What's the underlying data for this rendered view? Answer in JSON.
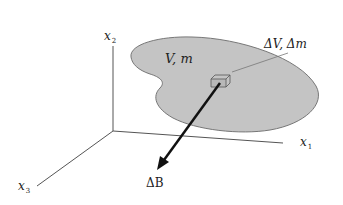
{
  "diagram": {
    "type": "3d-coordinate-body-sketch",
    "axes": [
      {
        "name": "x1",
        "symbol": "x",
        "subscript": "1"
      },
      {
        "name": "x2",
        "symbol": "x",
        "subscript": "2"
      },
      {
        "name": "x3",
        "symbol": "x",
        "subscript": "3"
      }
    ],
    "body_label": "V, m",
    "element_label": "ΔV, Δm",
    "vector_label": "ΔB",
    "colors": {
      "body_fill": "#c4c4c4",
      "body_stroke": "#777777",
      "axis": "#555555",
      "vector": "#111111",
      "text": "#222222"
    }
  }
}
